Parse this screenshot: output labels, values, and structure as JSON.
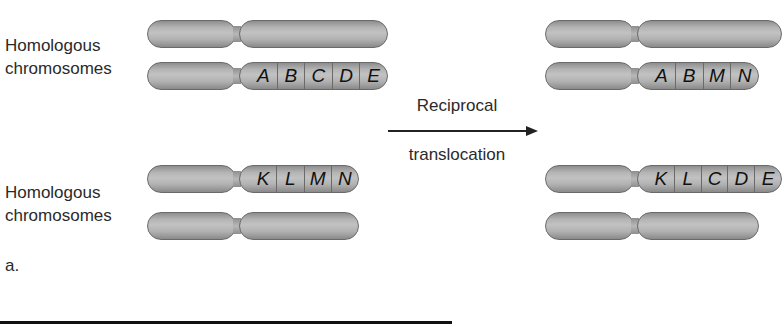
{
  "figure": {
    "panel_label": "a.",
    "left_groups": [
      {
        "label_line1": "Homologous",
        "label_line2": "chromosomes"
      },
      {
        "label_line1": "Homologous",
        "label_line2": "chromosomes"
      }
    ],
    "arrow": {
      "label_top": "Reciprocal",
      "label_bottom": "translocation"
    },
    "before": {
      "chrom1": {
        "genes": []
      },
      "chrom2": {
        "genes": [
          "A",
          "B",
          "C",
          "D",
          "E"
        ]
      },
      "chrom3": {
        "genes": [
          "K",
          "L",
          "M",
          "N"
        ]
      },
      "chrom4": {
        "genes": []
      }
    },
    "after": {
      "chrom1": {
        "genes": []
      },
      "chrom2": {
        "genes": [
          "A",
          "B",
          "M",
          "N"
        ]
      },
      "chrom3": {
        "genes": [
          "K",
          "L",
          "C",
          "D",
          "E"
        ]
      },
      "chrom4": {
        "genes": []
      }
    },
    "colors": {
      "chromosome_fill": "#b4b4b4",
      "chromosome_outline": "#6a6a6a",
      "text": "#222222"
    }
  }
}
